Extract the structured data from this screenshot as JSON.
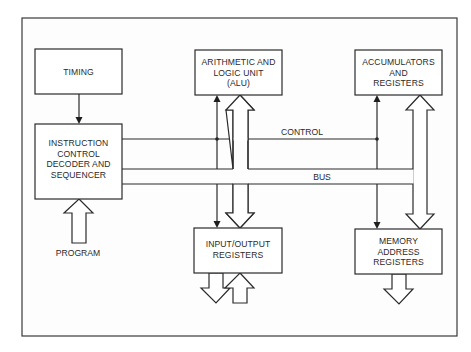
{
  "diagram": {
    "blocks": {
      "timing": {
        "lines": [
          "TIMING"
        ]
      },
      "instruction": {
        "lines": [
          "INSTRUCTION",
          "CONTROL",
          "DECODER AND",
          "SEQUENCER"
        ]
      },
      "alu": {
        "lines": [
          "ARITHMETIC AND",
          "LOGIC UNIT",
          "(ALU)"
        ]
      },
      "accumulators": {
        "lines": [
          "ACCUMULATORS",
          "AND",
          "REGISTERS"
        ]
      },
      "io": {
        "lines": [
          "INPUT/OUTPUT",
          "REGISTERS"
        ]
      },
      "memory": {
        "lines": [
          "MEMORY",
          "ADDRESS",
          "REGISTERS"
        ]
      }
    },
    "labels": {
      "control": "CONTROL",
      "bus": "BUS",
      "program": "PROGRAM"
    },
    "colors": {
      "line": "#2b2b2b",
      "background": "#ffffff"
    }
  }
}
